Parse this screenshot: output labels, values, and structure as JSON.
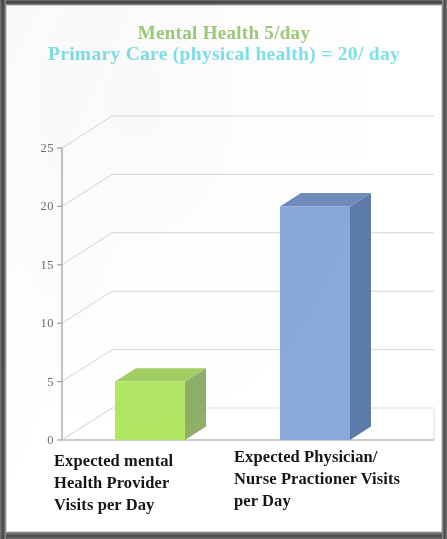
{
  "slide": {
    "title_line_1": "Mental Health 5/day",
    "title_line_2": "Primary Care (physical health) = 20/ day",
    "title_line_1_color": "#9ccb7a",
    "title_line_2_color": "#7fe0e8",
    "background_color": "#ffffff",
    "frame_color": "#4a4a4a"
  },
  "chart_data": {
    "type": "bar",
    "title": "Mental Health 5/day Primary Care (physical health) = 20/ day",
    "categories": [
      "Expected mental Health Provider Visits per Day",
      "Expected Physician/ Nurse Practioner Visits per Day"
    ],
    "category_lines": [
      [
        "Expected mental",
        "Health Provider",
        "Visits per Day"
      ],
      [
        "Expected Physician/",
        "Nurse Practioner Visits",
        "per Day"
      ]
    ],
    "values": [
      5,
      20
    ],
    "bar_colors": [
      "#b3e663",
      "#8aa8d8"
    ],
    "bar_side_colors": [
      "#8fae68",
      "#5d7ba8"
    ],
    "bar_top_colors": [
      "#a2cf62",
      "#6e8cbd"
    ],
    "xlabel": "",
    "ylabel": "",
    "ylim": [
      0,
      25
    ],
    "ytick_labels": [
      "0",
      "5",
      "10",
      "15",
      "20",
      "25"
    ],
    "ytick_values": [
      0,
      5,
      10,
      15,
      20,
      25
    ],
    "grid": true,
    "grid_color": "#d6d6d6",
    "legend": false,
    "three_d": true,
    "axis_color": "#9a9a9a"
  }
}
